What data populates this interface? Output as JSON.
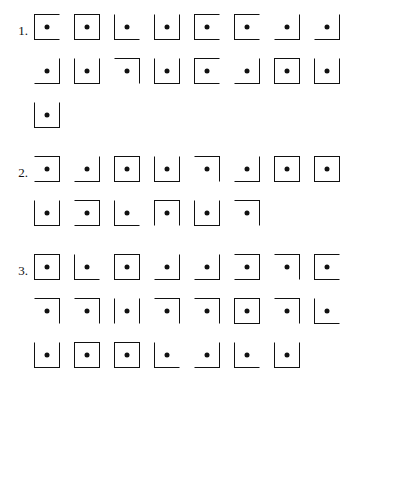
{
  "page": {
    "background_color": "#ffffff",
    "ink_color": "#111111",
    "glyph_description": "square outline with selected sides drawn and a filled dot at center"
  },
  "legend": {
    "side_codes": {
      "t": "top",
      "r": "right",
      "b": "bottom",
      "l": "left"
    }
  },
  "groups": [
    {
      "number": "1.",
      "rows": [
        {
          "items": [
            {
              "sides": "ltb"
            },
            {
              "sides": "ltrb"
            },
            {
              "sides": "lb"
            },
            {
              "sides": "lbr"
            },
            {
              "sides": "ltb"
            },
            {
              "sides": "ltb"
            },
            {
              "sides": "br"
            },
            {
              "sides": "br"
            }
          ]
        },
        {
          "items": [
            {
              "sides": "br"
            },
            {
              "sides": "lbr"
            },
            {
              "sides": "tr"
            },
            {
              "sides": "lbr"
            },
            {
              "sides": "ltb"
            },
            {
              "sides": "br"
            },
            {
              "sides": "ltrb"
            },
            {
              "sides": "lbr"
            }
          ]
        },
        {
          "items": [
            {
              "sides": "lbr"
            }
          ]
        }
      ]
    },
    {
      "number": "2.",
      "rows": [
        {
          "items": [
            {
              "sides": "trb"
            },
            {
              "sides": "br"
            },
            {
              "sides": "ltrb"
            },
            {
              "sides": "lbr"
            },
            {
              "sides": "tr"
            },
            {
              "sides": "br"
            },
            {
              "sides": "ltrb"
            },
            {
              "sides": "ltrb"
            }
          ]
        },
        {
          "items": [
            {
              "sides": "lbr"
            },
            {
              "sides": "trb"
            },
            {
              "sides": "lb"
            },
            {
              "sides": "ltr"
            },
            {
              "sides": "lbr"
            },
            {
              "sides": "tr"
            }
          ]
        }
      ]
    },
    {
      "number": "3.",
      "rows": [
        {
          "items": [
            {
              "sides": "ltrb"
            },
            {
              "sides": "lb"
            },
            {
              "sides": "ltrb"
            },
            {
              "sides": "rb"
            },
            {
              "sides": "rb"
            },
            {
              "sides": "trb"
            },
            {
              "sides": "tr"
            },
            {
              "sides": "ltb"
            }
          ]
        },
        {
          "items": [
            {
              "sides": "tr"
            },
            {
              "sides": "tr"
            },
            {
              "sides": "lr"
            },
            {
              "sides": "tr"
            },
            {
              "sides": "tr"
            },
            {
              "sides": "ltrb"
            },
            {
              "sides": "tr"
            },
            {
              "sides": "lb"
            }
          ]
        },
        {
          "items": [
            {
              "sides": "lbr"
            },
            {
              "sides": "ltrb"
            },
            {
              "sides": "ltrb"
            },
            {
              "sides": "lb"
            },
            {
              "sides": "br"
            },
            {
              "sides": "lb"
            },
            {
              "sides": "lbr"
            }
          ]
        }
      ]
    }
  ]
}
